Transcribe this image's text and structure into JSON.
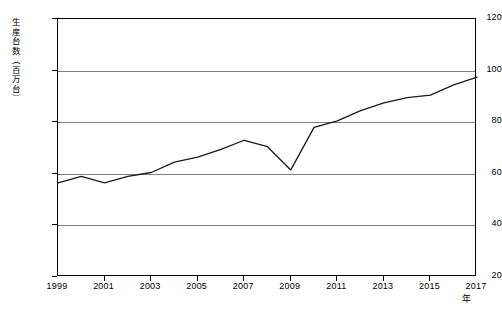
{
  "chart_data": {
    "type": "line",
    "title": "",
    "subtitle": "",
    "xlabel": "年",
    "ylabel": "生産台数（百万台）",
    "x": [
      1999,
      2000,
      2001,
      2002,
      2003,
      2004,
      2005,
      2006,
      2007,
      2008,
      2009,
      2010,
      2011,
      2012,
      2013,
      2014,
      2015,
      2016,
      2017
    ],
    "series": [
      {
        "name": "生産台数",
        "color": "#1a1a1a",
        "values": [
          56.5,
          59.0,
          56.5,
          59.0,
          60.5,
          64.5,
          66.5,
          69.5,
          73.0,
          70.5,
          61.5,
          78.0,
          80.5,
          84.5,
          87.5,
          89.5,
          90.5,
          94.5,
          97.5
        ]
      }
    ],
    "xlim": [
      1999,
      2017
    ],
    "ylim": [
      20,
      120
    ],
    "xticks": [
      1999,
      2001,
      2003,
      2005,
      2007,
      2009,
      2011,
      2013,
      2015,
      2017
    ],
    "xtick_labels": [
      "1999",
      "2001",
      "2003",
      "2005",
      "2007",
      "2009",
      "2011",
      "2013",
      "2015",
      "2017"
    ],
    "yticks": [
      20,
      40,
      60,
      80,
      100,
      120
    ],
    "ytick_labels": [
      "20",
      "40",
      "60",
      "80",
      "100",
      "120"
    ],
    "gridlines": {
      "horizontal": true,
      "vertical": false,
      "horizontal_values": [
        40,
        60,
        80,
        100,
        120
      ],
      "color": "#808080"
    },
    "legend": {
      "visible": false,
      "position": "none",
      "entries": []
    },
    "annotations": [],
    "markers": false,
    "plot_border": true
  }
}
